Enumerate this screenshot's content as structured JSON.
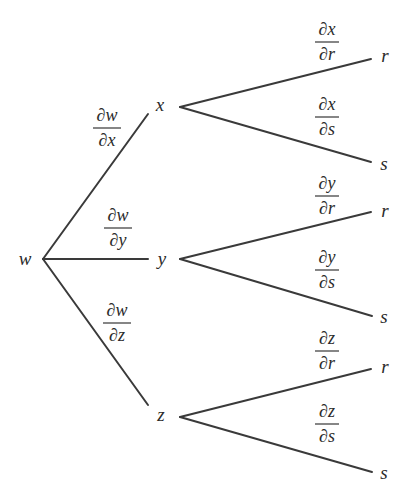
{
  "diagram": {
    "type": "tree",
    "root": {
      "label": "w",
      "x": 25,
      "y": 265
    },
    "middle": [
      {
        "id": "x",
        "label": "x",
        "x": 160,
        "y": 111
      },
      {
        "id": "y",
        "label": "y",
        "x": 162,
        "y": 265
      },
      {
        "id": "z",
        "label": "z",
        "x": 161,
        "y": 421
      }
    ],
    "leaves": [
      {
        "parent": "x",
        "label": "r",
        "x": 385,
        "y": 62
      },
      {
        "parent": "x",
        "label": "s",
        "x": 384,
        "y": 170
      },
      {
        "parent": "y",
        "label": "r",
        "x": 385,
        "y": 217
      },
      {
        "parent": "y",
        "label": "s",
        "x": 384,
        "y": 323
      },
      {
        "parent": "z",
        "label": "r",
        "x": 385,
        "y": 373
      },
      {
        "parent": "z",
        "label": "s",
        "x": 384,
        "y": 479
      }
    ],
    "edge_labels_level1": [
      {
        "id": "dw-dx",
        "num": "∂w",
        "den": "∂x",
        "cx": 107,
        "bar_y": 128
      },
      {
        "id": "dw-dy",
        "num": "∂w",
        "den": "∂y",
        "cx": 118,
        "bar_y": 228
      },
      {
        "id": "dw-dz",
        "num": "∂w",
        "den": "∂z",
        "cx": 117,
        "bar_y": 323
      }
    ],
    "edge_labels_level2": [
      {
        "id": "dx-dr",
        "num": "∂x",
        "den": "∂r",
        "cx": 327,
        "bar_y": 42
      },
      {
        "id": "dx-ds",
        "num": "∂x",
        "den": "∂s",
        "cx": 327,
        "bar_y": 117
      },
      {
        "id": "dy-dr",
        "num": "∂y",
        "den": "∂r",
        "cx": 327,
        "bar_y": 196
      },
      {
        "id": "dy-ds",
        "num": "∂y",
        "den": "∂s",
        "cx": 327,
        "bar_y": 270
      },
      {
        "id": "dz-dr",
        "num": "∂z",
        "den": "∂r",
        "cx": 327,
        "bar_y": 351
      },
      {
        "id": "dz-ds",
        "num": "∂z",
        "den": "∂s",
        "cx": 327,
        "bar_y": 424
      }
    ],
    "colors": {
      "line": "#3a3a3a",
      "text": "#2b2b2b",
      "background": "#ffffff"
    }
  }
}
